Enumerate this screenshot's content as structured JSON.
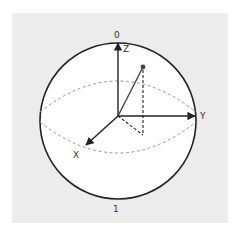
{
  "diagram": {
    "type": "bloch-sphere",
    "labels": {
      "top_state": "0",
      "bottom_state": "1",
      "z_axis": "Z",
      "y_axis": "Y",
      "x_axis": "X"
    },
    "colors": {
      "background_panel": "#ececec",
      "sphere_fill": "#ffffff",
      "outline": "#222222",
      "equator_dashed": "#999999",
      "axes": "#222222",
      "state_vector": "#444444",
      "projection_dashed": "#222222"
    }
  }
}
